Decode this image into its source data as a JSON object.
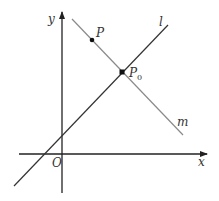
{
  "diagram": {
    "axes": {
      "x_label": "x",
      "y_label": "y",
      "origin_label": "O"
    },
    "lines": [
      {
        "name": "l",
        "label": "l",
        "color": "#333333"
      },
      {
        "name": "m",
        "label": "m",
        "color": "#8a8a8a"
      }
    ],
    "points": [
      {
        "name": "P",
        "label": "P"
      },
      {
        "name": "P0",
        "label": "P",
        "subscript": "0"
      }
    ]
  }
}
